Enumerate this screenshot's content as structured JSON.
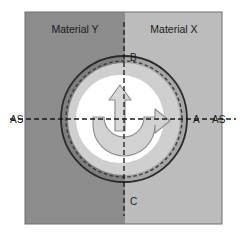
{
  "figure": {
    "width": 240,
    "height": 239
  },
  "materials": {
    "left": {
      "label": "Material Y",
      "color": "#8c8c8c",
      "label_x": 75,
      "label_y": 33
    },
    "right": {
      "label": "Material X",
      "color": "#bcbcbc",
      "label_x": 174,
      "label_y": 33
    },
    "interface_x": 125,
    "plate": {
      "x": 25,
      "y": 12,
      "width": 197,
      "height": 212,
      "border_color": "#6e6e6e"
    }
  },
  "tool": {
    "center_x": 124,
    "center_y": 119,
    "shoulder_radius": 63,
    "shoulder_color": "#a6a6a6",
    "outline_color": "#2b2b2b",
    "dashed_circle_radius": 58,
    "dashed_circle_color": "#3a3a3a",
    "ring_outer_radius": 56,
    "ring_color": "#cfcfcf",
    "pin_radius": 44,
    "pin_color": "#ffffff",
    "probe_offset_x": -4,
    "rotation_arrow_color": "#d2d2d2",
    "rotation_arrow_stroke": "#8f8f8f",
    "travel_arrow_color": "#d8d8d8",
    "travel_arrow_stroke": "#8f8f8f"
  },
  "axes": {
    "horizontal": {
      "y": 119,
      "x_start": 10,
      "x_end": 236,
      "color": "#1a1a1a",
      "dash": "5,3"
    },
    "vertical": {
      "x": 124,
      "y_start": 22,
      "y_end": 216,
      "color": "#1a1a1a",
      "dash": "5,3"
    }
  },
  "annotations": {
    "point_a": {
      "label": "A",
      "x": 193,
      "y": 123
    },
    "point_b": {
      "label": "B",
      "x": 130,
      "y": 61
    },
    "point_c": {
      "label": "C",
      "x": 130,
      "y": 205
    },
    "axis_left": {
      "label": "AS",
      "x": 10,
      "y": 123
    },
    "axis_right": {
      "label": "AS",
      "x": 212,
      "y": 123
    }
  }
}
